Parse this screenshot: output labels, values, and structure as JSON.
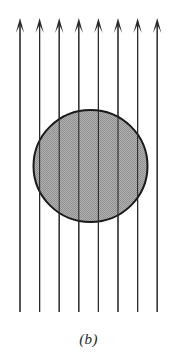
{
  "figure": {
    "caption": "(b)",
    "background_color": "#ffffff",
    "line_color": "#2b2b2b",
    "circle_outline_color": "#1a1a1a",
    "circle_fill_color": "#a8a8a8",
    "canvas": {
      "width": 177,
      "height": 364
    }
  },
  "field_lines": {
    "name": "vertical-field-arrows",
    "count": 8,
    "direction": "up",
    "x_positions": [
      20,
      39.6,
      59.2,
      78.8,
      98.4,
      118,
      137.6,
      157.2
    ],
    "line_top_y": 24,
    "line_bottom_y": 312,
    "stroke_width": 1.1,
    "arrowhead": {
      "name": "barbed-arrowhead",
      "tip_y": 18,
      "height": 15,
      "half_width": 4.2
    }
  },
  "region": {
    "name": "shaded-circle",
    "shape": "ellipse",
    "center_x": 90.5,
    "center_y": 166,
    "radius_x": 57,
    "radius_y": 56,
    "stroke_width": 2.0,
    "fill_pattern": "fine-stipple",
    "fill_base": "#ababab",
    "stipple_dot": "#8c8c8c"
  }
}
